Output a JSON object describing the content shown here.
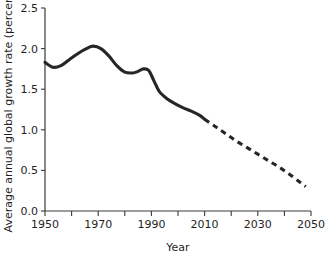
{
  "chart_data": {
    "type": "line",
    "title": "",
    "subtitle": "",
    "xlabel": "Year",
    "ylabel": "Average annual global growth rate (percent)",
    "xlim": [
      1950,
      2050
    ],
    "ylim": [
      0.0,
      2.5
    ],
    "grid": false,
    "legend": "none",
    "x_ticks": [
      1950,
      1970,
      1990,
      2010,
      2030,
      2050
    ],
    "x_tick_labels": [
      "1950",
      "1970",
      "1990",
      "2010",
      "2030",
      "2050"
    ],
    "x_minor_ticks": [
      1960,
      1980,
      2000,
      2020,
      2040
    ],
    "y_ticks": [
      0.0,
      0.5,
      1.0,
      1.5,
      2.0,
      2.5
    ],
    "y_tick_labels": [
      "0.0",
      "0.5",
      "1.0",
      "1.5",
      "2.0",
      "2.5"
    ],
    "series": [
      {
        "name": "Estimated growth rate",
        "style": "solid",
        "color": "#262626",
        "x": [
          1950,
          1953,
          1956,
          1959,
          1962,
          1965,
          1968,
          1971,
          1974,
          1977,
          1980,
          1983,
          1985,
          1987,
          1989,
          1991,
          1993,
          1996,
          1999,
          2002,
          2005,
          2008,
          2010
        ],
        "values": [
          1.83,
          1.77,
          1.79,
          1.86,
          1.93,
          1.99,
          2.03,
          2.0,
          1.91,
          1.79,
          1.71,
          1.7,
          1.72,
          1.75,
          1.73,
          1.6,
          1.47,
          1.38,
          1.32,
          1.27,
          1.23,
          1.18,
          1.13
        ]
      },
      {
        "name": "Projected growth rate",
        "style": "dashed",
        "color": "#262626",
        "x": [
          2010,
          2014,
          2018,
          2022,
          2026,
          2030,
          2034,
          2038,
          2042,
          2046,
          2048
        ],
        "values": [
          1.13,
          1.04,
          0.95,
          0.86,
          0.78,
          0.7,
          0.62,
          0.54,
          0.45,
          0.35,
          0.3
        ]
      }
    ]
  }
}
